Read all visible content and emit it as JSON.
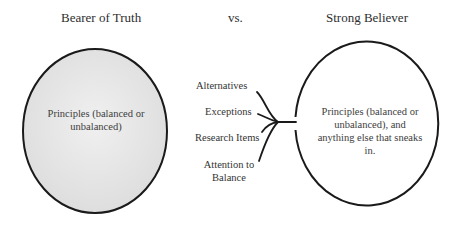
{
  "titles": {
    "left": "Bearer of Truth",
    "middle": "vs.",
    "right": "Strong Believer"
  },
  "left_circle": {
    "text": "Principles (balanced or unbalanced)",
    "fill": "#e6e6e6",
    "stroke": "#1a1a1a"
  },
  "right_circle": {
    "text": "Principles (balanced or unbalanced), and anything else that sneaks in.",
    "fill": "#ffffff",
    "stroke": "#1a1a1a"
  },
  "inputs": [
    {
      "label": "Alternatives"
    },
    {
      "label": "Exceptions"
    },
    {
      "label": "Research Items"
    },
    {
      "label": "Attention to Balance"
    }
  ]
}
